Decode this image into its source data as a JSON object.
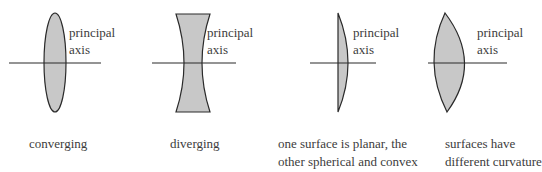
{
  "colors": {
    "lens_fill": "#c8c8c8",
    "stroke": "#2a2a2a",
    "text": "#3c3c3c",
    "background": "#ffffff"
  },
  "lenses": [
    {
      "type": "converging",
      "axis_label_line1": "principal",
      "axis_label_line2": "axis",
      "caption_line1": "converging",
      "caption_line2": ""
    },
    {
      "type": "diverging",
      "axis_label_line1": "principal",
      "axis_label_line2": "axis",
      "caption_line1": "diverging",
      "caption_line2": ""
    },
    {
      "type": "plano-convex",
      "axis_label_line1": "principal",
      "axis_label_line2": "axis",
      "caption_line1": "one surface is planar, the",
      "caption_line2": "other spherical and convex"
    },
    {
      "type": "meniscus",
      "axis_label_line1": "principal",
      "axis_label_line2": "axis",
      "caption_line1": "surfaces have",
      "caption_line2": "different curvature"
    }
  ]
}
